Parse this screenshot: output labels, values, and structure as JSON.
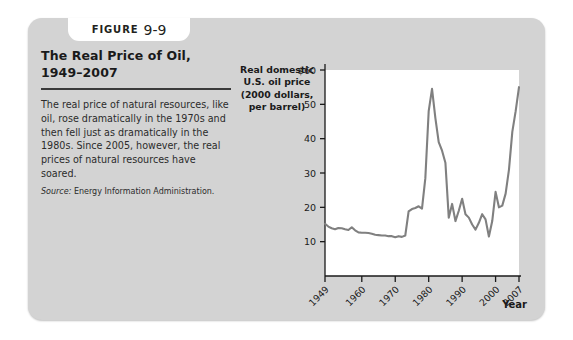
{
  "figure": {
    "tab_word": "Figure",
    "tab_number": "9-9",
    "title": "The Real Price of Oil, 1949–2007",
    "caption": "The real price of natural resources, like oil, rose dramatically in the 1970s and then fell just as dramatically in the 1980s. Since 2005, however, the real prices of natural resources have soared.",
    "source_label": "Source:",
    "source_text": "Energy Information Administration."
  },
  "colors": {
    "card_background": "#d3d3d3",
    "page_background": "#ffffff",
    "plot_background": "#ffffff",
    "line": "#808080",
    "axis": "#1a1a1a",
    "text": "#1a1a1a"
  },
  "chart_data": {
    "type": "line",
    "title": "The Real Price of Oil, 1949–2007",
    "ylabel": "Real domestic U.S. oil price (2000 dollars, per barrel)",
    "xlabel": "Year",
    "ylim": [
      0,
      60
    ],
    "xlim": [
      1949,
      2007
    ],
    "grid": false,
    "legend": "none",
    "ytick_labels": [
      "$60",
      "50",
      "40",
      "30",
      "20",
      "10"
    ],
    "ytick_values": [
      60,
      50,
      40,
      30,
      20,
      10
    ],
    "xtick_labels": [
      "1949",
      "1960",
      "1970",
      "1980",
      "1990",
      "2000",
      "2007"
    ],
    "xtick_values": [
      1949,
      1960,
      1970,
      1980,
      1990,
      2000,
      2007
    ],
    "series": [
      {
        "name": "Real domestic U.S. oil price",
        "x": [
          1949,
          1950,
          1951,
          1952,
          1953,
          1954,
          1955,
          1956,
          1957,
          1958,
          1959,
          1960,
          1961,
          1962,
          1963,
          1964,
          1965,
          1966,
          1967,
          1968,
          1969,
          1970,
          1971,
          1972,
          1973,
          1974,
          1975,
          1976,
          1977,
          1978,
          1979,
          1980,
          1981,
          1982,
          1983,
          1984,
          1985,
          1986,
          1987,
          1988,
          1989,
          1990,
          1991,
          1992,
          1993,
          1994,
          1995,
          1996,
          1997,
          1998,
          1999,
          2000,
          2001,
          2002,
          2003,
          2004,
          2005,
          2006,
          2007
        ],
        "y": [
          15.2,
          14.4,
          13.9,
          13.6,
          14.0,
          13.9,
          13.6,
          13.4,
          14.2,
          13.3,
          12.7,
          12.6,
          12.6,
          12.5,
          12.3,
          12.0,
          11.9,
          11.8,
          11.8,
          11.6,
          11.6,
          11.3,
          11.6,
          11.4,
          11.8,
          18.8,
          19.5,
          19.8,
          20.3,
          19.6,
          28.5,
          48.0,
          54.5,
          46.0,
          39.0,
          36.5,
          33.0,
          17.0,
          21.0,
          16.0,
          19.0,
          22.5,
          18.0,
          17.0,
          15.0,
          13.5,
          15.5,
          18.0,
          16.5,
          11.5,
          16.0,
          24.5,
          20.0,
          20.5,
          24.0,
          31.0,
          42.0,
          48.0,
          55.0
        ]
      }
    ]
  }
}
